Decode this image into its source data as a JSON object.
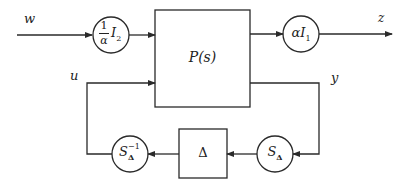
{
  "diagram": {
    "type": "block-diagram",
    "signals": {
      "w": "w",
      "z": "z",
      "u": "u",
      "y": "y"
    },
    "plant": {
      "label": "P(s)"
    },
    "input_scaling": {
      "label_num": "1",
      "label_den": "α",
      "label_suffix": "I",
      "label_sub": "2"
    },
    "output_scaling": {
      "label_prefix": "α",
      "label_main": "I",
      "label_sub": "1"
    },
    "uncertainty": {
      "label": "Δ"
    },
    "scaling_right": {
      "label_main": "S",
      "label_sub": "Δ"
    },
    "scaling_left": {
      "label_main": "S",
      "label_sub": "Δ",
      "label_sup": "−1"
    },
    "colors": {
      "stroke": "#2a2a2a",
      "background": "#ffffff"
    }
  }
}
